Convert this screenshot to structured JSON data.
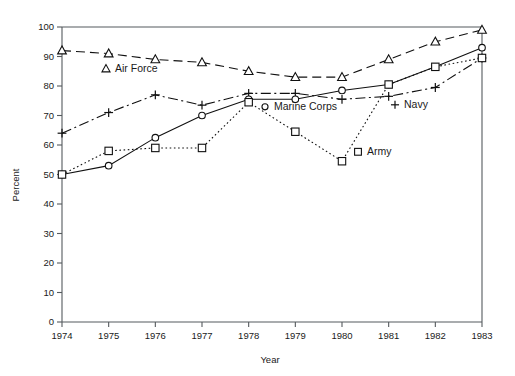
{
  "chart_data": {
    "type": "line",
    "title": "",
    "subtitle": "",
    "xlabel": "Year",
    "ylabel": "Percent",
    "categories": [
      "1974",
      "1975",
      "1976",
      "1977",
      "1978",
      "1979",
      "1980",
      "1981",
      "1982",
      "1983"
    ],
    "x": [
      1974,
      1975,
      1976,
      1977,
      1978,
      1979,
      1980,
      1981,
      1982,
      1983
    ],
    "xlim": [
      1974,
      1983
    ],
    "ylim": [
      0,
      100
    ],
    "y_ticks": [
      0,
      10,
      20,
      30,
      40,
      50,
      60,
      70,
      80,
      90,
      100
    ],
    "y_tick_labels": [
      "0",
      "10",
      "20",
      "30",
      "40",
      "50",
      "60",
      "70",
      "80",
      "90",
      "100"
    ],
    "grid": false,
    "legend_position": "inline-annotations",
    "series": [
      {
        "name": "Air Force",
        "marker": "triangle",
        "linestyle": "dashed",
        "color": "#101010",
        "values": [
          92,
          91,
          89,
          88,
          85,
          83,
          83,
          89,
          95,
          99
        ]
      },
      {
        "name": "Navy",
        "marker": "plus",
        "linestyle": "dashdot",
        "color": "#101010",
        "values": [
          64,
          71,
          77,
          73.5,
          77.5,
          77.5,
          75.5,
          76.5,
          79.5,
          89.5
        ]
      },
      {
        "name": "Marine Corps",
        "marker": "circle",
        "linestyle": "solid",
        "color": "#101010",
        "values": [
          50,
          53,
          62.5,
          70,
          75.5,
          75.5,
          78.5,
          80.5,
          86.5,
          93
        ]
      },
      {
        "name": "Army",
        "marker": "square",
        "linestyle": "dotted",
        "color": "#101010",
        "values": [
          50,
          58,
          59,
          59,
          74.5,
          64.5,
          54.5,
          80.5,
          86.5,
          89.5
        ]
      }
    ],
    "annotations": [
      {
        "text": "Air Force",
        "marker": "triangle",
        "x_px": 106,
        "y_px": 72
      },
      {
        "text": "Marine Corps",
        "marker": "circle",
        "x_px": 265,
        "y_px": 110
      },
      {
        "text": "Navy",
        "marker": "plus",
        "x_px": 395,
        "y_px": 108
      },
      {
        "text": "Army",
        "marker": "square",
        "x_px": 358,
        "y_px": 155
      }
    ]
  },
  "axes": {
    "x_axis_label": "Year",
    "y_axis_label": "Percent"
  }
}
